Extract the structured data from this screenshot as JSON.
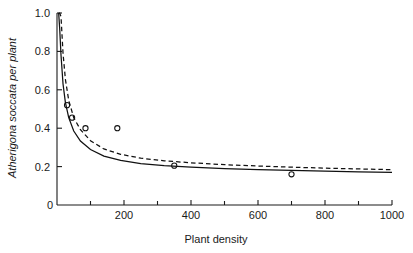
{
  "chart_data": {
    "type": "line",
    "title": "",
    "xlabel": "Plant density",
    "ylabel": "Atherigona soccata per plant",
    "ylabel_style": "italic",
    "xlim": [
      0,
      1000
    ],
    "ylim": [
      0,
      1.0
    ],
    "grid": false,
    "legend": "none",
    "x_ticks": [
      0,
      200,
      400,
      600,
      800,
      1000
    ],
    "x_tick_labels": [
      "0",
      "200",
      "400",
      "600",
      "800",
      "1000"
    ],
    "x_minor_ticks": [
      100,
      300,
      500,
      700,
      900
    ],
    "y_ticks": [
      0,
      0.2,
      0.4,
      0.6,
      0.8,
      1.0
    ],
    "y_tick_labels": [
      "0",
      "0.2",
      "0.4",
      "0.6",
      "0.8",
      "1.0"
    ],
    "series": [
      {
        "name": "fitted-curve-solid",
        "style": "solid",
        "color": "#111111",
        "model": "hyperbolic decay",
        "x": [
          5,
          8,
          12,
          18,
          25,
          35,
          50,
          70,
          100,
          140,
          190,
          250,
          320,
          400,
          500,
          600,
          700,
          800,
          900,
          1000
        ],
        "y": [
          1.0,
          0.92,
          0.78,
          0.63,
          0.535,
          0.455,
          0.385,
          0.333,
          0.289,
          0.255,
          0.232,
          0.216,
          0.205,
          0.197,
          0.189,
          0.184,
          0.18,
          0.176,
          0.173,
          0.17
        ]
      },
      {
        "name": "fitted-curve-dashed",
        "style": "dashed",
        "color": "#111111",
        "model": "hyperbolic decay",
        "x": [
          5,
          8,
          12,
          18,
          25,
          35,
          50,
          70,
          100,
          140,
          190,
          250,
          320,
          400,
          500,
          600,
          700,
          800,
          900,
          1000
        ],
        "y": [
          1.0,
          1.0,
          0.98,
          0.79,
          0.655,
          0.545,
          0.455,
          0.392,
          0.335,
          0.292,
          0.264,
          0.244,
          0.23,
          0.22,
          0.21,
          0.203,
          0.197,
          0.192,
          0.188,
          0.184
        ]
      }
    ],
    "points": {
      "name": "observed-data",
      "marker": "open-circle",
      "x": [
        30,
        45,
        85,
        180,
        350,
        700
      ],
      "y": [
        0.52,
        0.455,
        0.4,
        0.4,
        0.205,
        0.16
      ]
    }
  },
  "axes": {
    "x_axis_name": "Plant density",
    "y_axis_name": "Atherigona soccata per plant"
  }
}
